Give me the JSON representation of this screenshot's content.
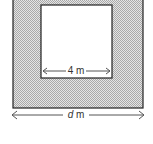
{
  "diagram": {
    "inner_square": {
      "label": "4 m",
      "side": "4",
      "unit": "m"
    },
    "outer_square": {
      "label_var": "d",
      "label_unit": "m"
    },
    "colors": {
      "shade": "#cfcfcf",
      "stroke": "#222222",
      "arrow": "#555555",
      "background": "#ffffff"
    }
  }
}
